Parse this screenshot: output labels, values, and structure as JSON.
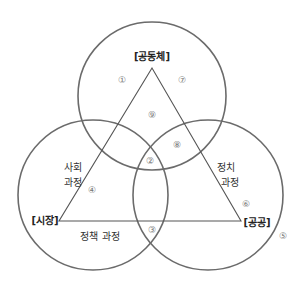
{
  "diagram": {
    "nodes": {
      "community": "[공동체]",
      "market": "[시장]",
      "public": "[공공]"
    },
    "edges": {
      "social_process_line1": "사회",
      "social_process_line2": "과정",
      "political_process_line1": "정치",
      "political_process_line2": "과정",
      "policy_process": "정책 과정"
    },
    "regions": {
      "r1": "①",
      "r2": "②",
      "r3": "③",
      "r4": "④",
      "r5": "⑤",
      "r6": "⑥",
      "r7": "⑦",
      "r8": "⑧",
      "r9": "⑨"
    },
    "colors": {
      "circle_stroke": "#6b6b6b",
      "triangle_stroke": "#555555",
      "text": "#333333",
      "region_number": "#777777"
    }
  }
}
